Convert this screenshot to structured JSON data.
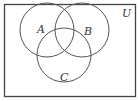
{
  "diagram": {
    "type": "venn",
    "universe_label": "U",
    "sets": [
      {
        "label": "A",
        "cx": 47,
        "cy": 30,
        "r": 27
      },
      {
        "label": "B",
        "cx": 82,
        "cy": 30,
        "r": 27
      },
      {
        "label": "C",
        "cx": 64,
        "cy": 55,
        "r": 27
      }
    ],
    "colors": {
      "stroke": "#555555",
      "background": "#ffffff",
      "frame": "#444444"
    }
  }
}
